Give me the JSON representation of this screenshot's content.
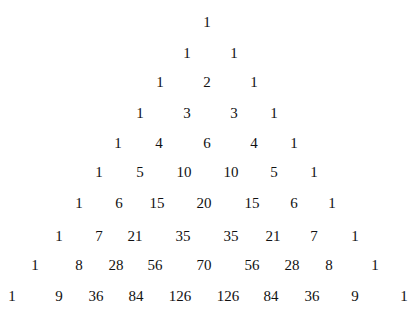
{
  "rows": [
    {
      "y": 22,
      "values": [
        "1"
      ],
      "x": [
        207
      ]
    },
    {
      "y": 53,
      "values": [
        "1",
        "1"
      ],
      "x": [
        187,
        234
      ]
    },
    {
      "y": 82,
      "values": [
        "1",
        "2",
        "1"
      ],
      "x": [
        160,
        207,
        254
      ]
    },
    {
      "y": 113,
      "values": [
        "1",
        "3",
        "3",
        "1"
      ],
      "x": [
        140,
        187,
        234,
        274
      ]
    },
    {
      "y": 143,
      "values": [
        "1",
        "4",
        "6",
        "4",
        "1"
      ],
      "x": [
        118,
        159,
        207,
        254,
        294
      ]
    },
    {
      "y": 172,
      "values": [
        "1",
        "5",
        "10",
        "10",
        "5",
        "1"
      ],
      "x": [
        99,
        140,
        184,
        231,
        274,
        314
      ]
    },
    {
      "y": 203,
      "values": [
        "1",
        "6",
        "15",
        "20",
        "15",
        "6",
        "1"
      ],
      "x": [
        79,
        119,
        157,
        204,
        252,
        294,
        332
      ]
    },
    {
      "y": 236,
      "values": [
        "1",
        "7",
        "21",
        "35",
        "35",
        "21",
        "7",
        "1"
      ],
      "x": [
        59,
        99,
        135,
        183,
        231,
        273,
        314,
        355
      ]
    },
    {
      "y": 265,
      "values": [
        "1",
        "8",
        "28",
        "56",
        "70",
        "56",
        "28",
        "8",
        "1"
      ],
      "x": [
        35,
        79,
        116,
        155,
        204,
        252,
        292,
        329,
        375
      ]
    },
    {
      "y": 296,
      "values": [
        "1",
        "9",
        "36",
        "84",
        "126",
        "126",
        "84",
        "36",
        "9",
        "1"
      ],
      "x": [
        12,
        59,
        96,
        136,
        180,
        228,
        271,
        312,
        355,
        404
      ]
    }
  ]
}
